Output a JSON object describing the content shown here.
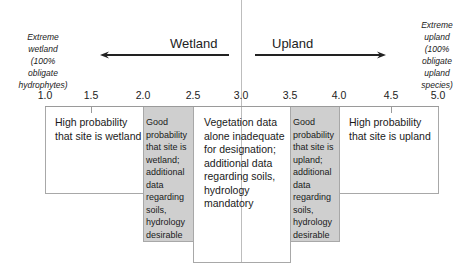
{
  "endpoints": {
    "left": {
      "lines": [
        "Extreme",
        "wetland",
        "(100%",
        "obligate",
        "hydrophytes)"
      ]
    },
    "right": {
      "lines": [
        "Extreme",
        "upland",
        "(100%",
        "obligate",
        "upland",
        "species)"
      ]
    }
  },
  "directions": {
    "wetland": "Wetland",
    "upland": "Upland"
  },
  "axis": {
    "ticks": [
      "1.0",
      "1.5",
      "2.0",
      "2.5",
      "3.0",
      "3.5",
      "4.0",
      "4.5",
      "5.0"
    ]
  },
  "zones": [
    {
      "range": "1.0-2.0",
      "shade": "white",
      "lines": [
        "High probability",
        "that site is wetland"
      ]
    },
    {
      "range": "2.0-2.5",
      "shade": "grey",
      "lines": [
        "Good",
        "probability",
        "that site is",
        "wetland;",
        "additional",
        "data",
        "regarding",
        "soils,",
        "hydrology",
        "desirable"
      ]
    },
    {
      "range": "2.5-3.5",
      "shade": "white",
      "lines": [
        "Vegetation data",
        "alone inadequate",
        "for designation;",
        "additional data",
        "regarding soils,",
        "hydrology",
        "mandatory"
      ]
    },
    {
      "range": "3.5-4.0",
      "shade": "grey",
      "lines": [
        "Good",
        "probability",
        "that site is",
        "upland;",
        "additional",
        "data",
        "regarding",
        "soils,",
        "hydrology",
        "desirable"
      ]
    },
    {
      "range": "4.0-5.0",
      "shade": "white",
      "lines": [
        "High probability",
        "that site is upland"
      ]
    }
  ],
  "colors": {
    "grey_zone": "#cfcfcf",
    "border": "#a8a8a8",
    "text": "#1a1a1a"
  }
}
